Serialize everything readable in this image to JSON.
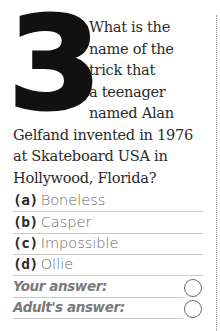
{
  "question": {
    "number": "3",
    "lines_beside_number": [
      "What is the",
      "name of the",
      "trick that",
      "a teenager",
      "named Alan"
    ],
    "lines_full_width": [
      "Gelfand invented in 1976",
      "at Skateboard USA in",
      "Hollywood, Florida?"
    ]
  },
  "options": [
    {
      "letter": "(a)",
      "text": "Boneless"
    },
    {
      "letter": "(b)",
      "text": "Casper"
    },
    {
      "letter": "(c)",
      "text": "Impossible"
    },
    {
      "letter": "(d)",
      "text": "Ollie"
    }
  ],
  "answers": {
    "your_answer_label": "Your answer:",
    "adult_answer_label": "Adult's answer:"
  }
}
